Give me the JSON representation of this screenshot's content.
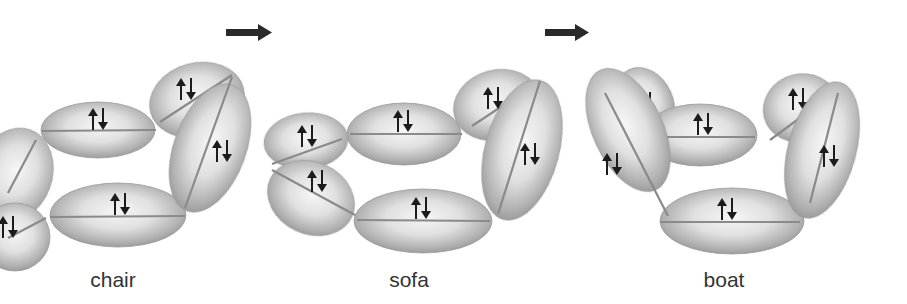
{
  "figure": {
    "transition_arrow_count": 2,
    "colors": {
      "orbital_light": "#f4f4f4",
      "orbital_mid": "#c8c8c8",
      "orbital_dark": "#8e8e8e",
      "bond_line": "#8a8a8a",
      "spin_arrow": "#1c1c1c",
      "arrow": "#2a2a2a",
      "label": "#333333"
    },
    "spin_symbol": "↑↓"
  },
  "conformations": [
    {
      "id": "chair",
      "label": "chair",
      "bond_count": 6,
      "each_bond_electrons": "↑↓",
      "note": "leftmost bonds partially cropped by image edge"
    },
    {
      "id": "sofa",
      "label": "sofa",
      "bond_count": 6,
      "each_bond_electrons": "↑↓"
    },
    {
      "id": "boat",
      "label": "boat",
      "bond_count": 6,
      "each_bond_electrons": "↑↓"
    }
  ],
  "arrows": [
    {
      "from": "chair",
      "to": "sofa",
      "direction": "right"
    },
    {
      "from": "sofa",
      "to": "boat",
      "direction": "right"
    }
  ]
}
